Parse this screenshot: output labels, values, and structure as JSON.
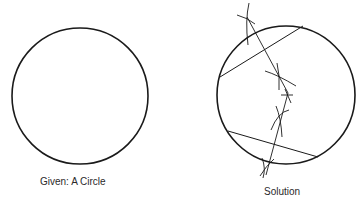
{
  "figures": {
    "given": {
      "caption": "Given: A Circle",
      "circle": {
        "cx": 80,
        "cy": 96,
        "r": 68
      }
    },
    "solution": {
      "caption": "Solution",
      "circle": {
        "cx": 286,
        "cy": 95,
        "r": 69
      },
      "chords": [
        {
          "x1": 220,
          "y1": 77,
          "x2": 303,
          "y2": 26
        },
        {
          "x1": 228,
          "y1": 131,
          "x2": 318,
          "y2": 157
        }
      ],
      "bisectors": [
        {
          "x1": 247,
          "y1": 17,
          "x2": 288,
          "y2": 93
        },
        {
          "x1": 288,
          "y1": 93,
          "x2": 266,
          "y2": 175
        }
      ],
      "center_mark": {
        "x": 287,
        "y": 95
      }
    }
  },
  "colors": {
    "stroke": "#1a1a1a",
    "background": "#ffffff"
  }
}
